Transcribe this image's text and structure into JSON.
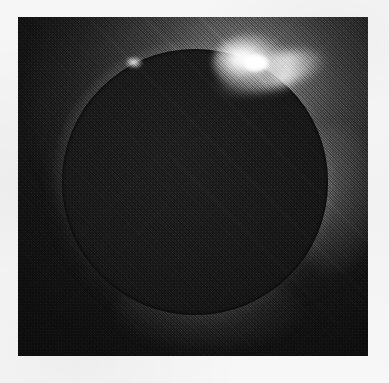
{
  "page": {
    "kind": "scanned-photograph",
    "width": 389,
    "height": 383,
    "background_color": "#f4f4f4"
  },
  "photo": {
    "subject": "total solar eclipse",
    "effect": "diamond ring",
    "medium": "halftone printed black-and-white photograph",
    "frame": {
      "left": 18,
      "top": 17,
      "width": 350,
      "height": 339
    },
    "alt_text": "Black and white photograph of a total solar eclipse showing the dark lunar disk silhouetted against the solar corona, with a brilliant diamond-ring bead of sunlight at the upper right limb."
  },
  "features": {
    "moon_disk": {
      "label": "lunar disk",
      "center_x": 195,
      "center_y": 182,
      "radius": 133,
      "color": "#1a1a1a"
    },
    "corona": {
      "label": "solar corona",
      "brightest_direction": "upper-right",
      "color": "#d8d8d8"
    },
    "diamond_ring": {
      "label": "diamond ring bead",
      "center_x": 250,
      "center_y": 62,
      "color": "#ffffff"
    },
    "prominence_bead": {
      "label": "limb bead",
      "center_x": 134,
      "center_y": 62,
      "color": "#f0f0f0"
    },
    "sky": {
      "label": "night sky",
      "color": "#141414"
    }
  },
  "colors": {
    "paper": "#f4f4f4",
    "sky_dark": "#141414",
    "disk_dark": "#1a1a1a",
    "corona_bright": "#e4e4e4",
    "highlight_white": "#ffffff"
  }
}
